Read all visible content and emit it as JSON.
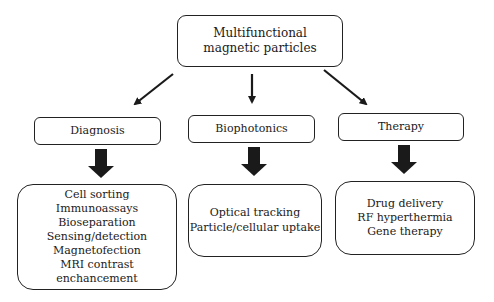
{
  "root": {
    "lines": [
      "Multifunctional",
      "magnetic particles"
    ]
  },
  "categories": [
    {
      "label": "Diagnosis",
      "items": [
        "Cell sorting",
        "Immunoassays",
        "Bioseparation",
        "Sensing/detection",
        "Magnetofection",
        "MRI contrast enchancement"
      ]
    },
    {
      "label": "Biophotonics",
      "items": [
        "Optical tracking",
        "Particle/cellular uptake"
      ]
    },
    {
      "label": "Therapy",
      "items": [
        "Drug delivery",
        "RF hyperthermia",
        "Gene therapy"
      ]
    }
  ],
  "colors": {
    "stroke": "#222222",
    "arrow": "#1a1a1a",
    "background": "#ffffff"
  }
}
